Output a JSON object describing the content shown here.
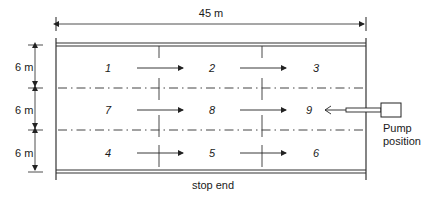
{
  "diagram": {
    "width_label": "45 m",
    "row_heights": [
      "6 m",
      "6 m",
      "6 m"
    ],
    "bottom_label": "stop end",
    "pump_label_line1": "Pump",
    "pump_label_line2": "position",
    "cells": {
      "row1": [
        "1",
        "2",
        "3"
      ],
      "row2": [
        "7",
        "8",
        "9"
      ],
      "row3": [
        "4",
        "5",
        "6"
      ]
    },
    "colors": {
      "line": "#2a2a2a",
      "dashed": "#444444",
      "background": "#ffffff"
    }
  }
}
